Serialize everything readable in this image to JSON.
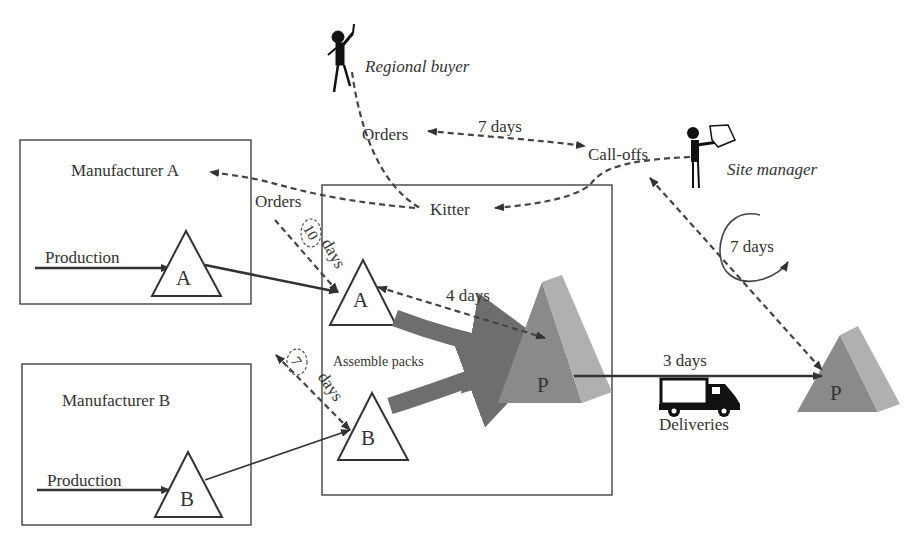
{
  "diagram": {
    "actors": {
      "regional_buyer": "Regional buyer",
      "site_manager": "Site manager"
    },
    "nodes": {
      "manufacturer_a": {
        "title": "Manufacturer A",
        "production_label": "Production",
        "stock": "A"
      },
      "manufacturer_b": {
        "title": "Manufacturer B",
        "production_label": "Production",
        "stock": "B"
      },
      "kitter": {
        "title": "Kitter",
        "stock_a": "A",
        "stock_b": "B",
        "assemble_label": "Assemble packs",
        "packs": "P"
      },
      "site": {
        "packs": "P"
      }
    },
    "flows": {
      "orders_top": "Orders",
      "orders_top_lead": "7 days",
      "call_offs": "Call-offs",
      "orders_a": "Orders",
      "orders_a_lead_num": "10",
      "orders_a_lead_unit": "days",
      "orders_b_lead_num": "7",
      "orders_b_lead_unit": "days",
      "a_to_p_lead": "4 days",
      "site_cycle": "7 days",
      "delivery_lead": "3 days",
      "deliveries": "Deliveries"
    },
    "colors": {
      "line": "#333333",
      "pack_dark": "#8a8a8a",
      "pack_light": "#b0b0b0",
      "arrow_fat": "#6e6e6e"
    }
  }
}
